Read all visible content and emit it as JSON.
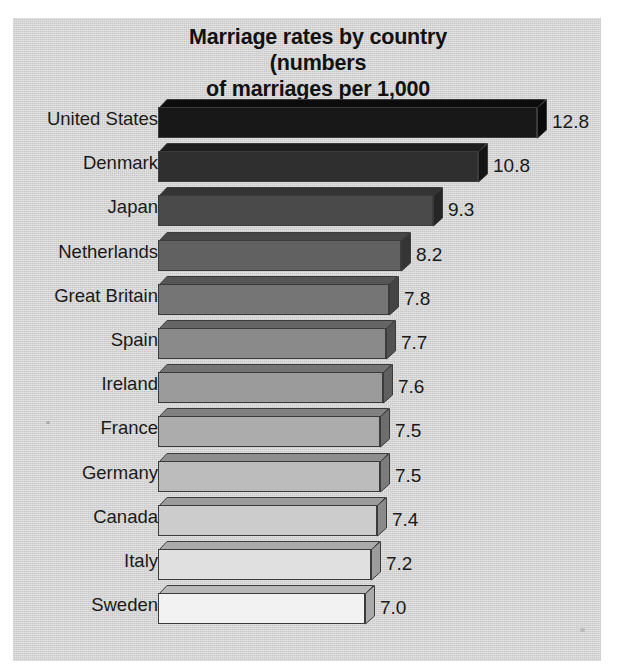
{
  "figure": {
    "title": "Marriage rates by country (numbers\nof marriages per 1,000 population)",
    "background_color": "#c9c9c9",
    "page_color": "#ffffff",
    "text_color": "#1a1a1a"
  },
  "chart_data": {
    "type": "bar",
    "orientation": "horizontal",
    "title": "Marriage rates by country (numbers of marriages per 1,000 population)",
    "xlabel": "",
    "ylabel": "",
    "xlim": [
      0,
      13.6
    ],
    "grid": false,
    "legend": null,
    "value_labels_shown": true,
    "categories": [
      "United States",
      "Denmark",
      "Japan",
      "Netherlands",
      "Great Britain",
      "Spain",
      "Ireland",
      "France",
      "Germany",
      "Canada",
      "Italy",
      "Sweden"
    ],
    "values": [
      12.8,
      10.8,
      9.3,
      8.2,
      7.8,
      7.7,
      7.6,
      7.5,
      7.5,
      7.4,
      7.2,
      7.0
    ],
    "value_text": [
      "12.8",
      "10.8",
      "9.3",
      "8.2",
      "7.8",
      "7.7",
      "7.6",
      "7.5",
      "7.5",
      "7.4",
      "7.2",
      "7.0"
    ],
    "bar_face_colors": [
      "#181818",
      "#2f2f2f",
      "#4a4a4a",
      "#616161",
      "#757575",
      "#8a8a8a",
      "#9b9b9b",
      "#acacac",
      "#bcbcbc",
      "#cccccc",
      "#e0e0e0",
      "#f2f2f2"
    ],
    "bar_top_colors": [
      "#0c0c0c",
      "#1e1e1e",
      "#343434",
      "#464646",
      "#565656",
      "#656565",
      "#737373",
      "#818181",
      "#8e8e8e",
      "#9b9b9b",
      "#ababab",
      "#b9b9b9"
    ],
    "bar_side_colors": [
      "#0a0a0a",
      "#151515",
      "#262626",
      "#353535",
      "#444444",
      "#525252",
      "#606060",
      "#6e6e6e",
      "#7c7c7c",
      "#8a8a8a",
      "#9c9c9c",
      "#aaaaaa"
    ]
  }
}
